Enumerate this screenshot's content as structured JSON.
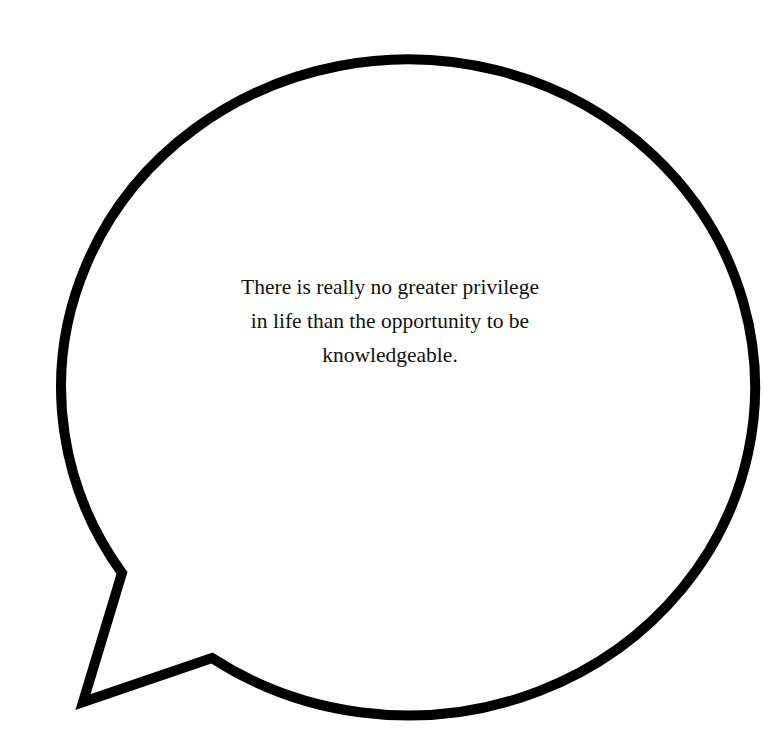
{
  "bubble": {
    "stroke_color": "#000000",
    "fill_color": "#ffffff"
  },
  "quote": {
    "lines": [
      "There is really no greater privilege",
      "in life than the opportunity to be",
      "knowledgeable."
    ]
  }
}
